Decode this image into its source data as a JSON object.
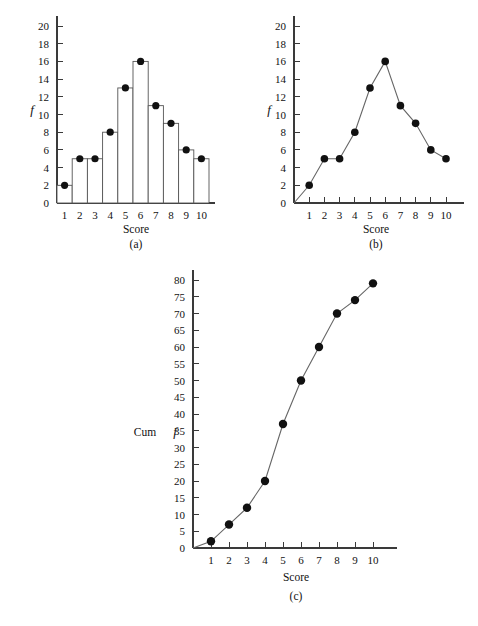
{
  "chart_data": [
    {
      "type": "bar",
      "panel": "(a)",
      "title": "",
      "xlabel": "Score",
      "ylabel": "f",
      "categories": [
        "1",
        "2",
        "3",
        "4",
        "5",
        "6",
        "7",
        "8",
        "9",
        "10"
      ],
      "values": [
        2,
        5,
        5,
        8,
        13,
        16,
        11,
        9,
        6,
        5
      ],
      "xlim": [
        0.5,
        10.5
      ],
      "ylim": [
        0,
        20
      ],
      "yticks": [
        0,
        2,
        4,
        6,
        8,
        10,
        12,
        14,
        16,
        18,
        20
      ],
      "ytick_labels": [
        "0",
        "2",
        "4",
        "6",
        "8",
        "10",
        "12",
        "14",
        "16",
        "18",
        "20"
      ],
      "xticks": [
        1,
        2,
        3,
        4,
        5,
        6,
        7,
        8,
        9,
        10
      ],
      "grid": false,
      "legend": "none",
      "markers": "filled-circle-at-bar-midpoint"
    },
    {
      "type": "line",
      "panel": "(b)",
      "title": "",
      "xlabel": "Score",
      "ylabel": "f",
      "categories": [
        "1",
        "2",
        "3",
        "4",
        "5",
        "6",
        "7",
        "8",
        "9",
        "10"
      ],
      "x": [
        0,
        1,
        2,
        3,
        4,
        5,
        6,
        7,
        8,
        9,
        10
      ],
      "values": [
        0,
        2,
        5,
        5,
        8,
        13,
        16,
        11,
        9,
        6,
        5
      ],
      "xlim": [
        0,
        11
      ],
      "ylim": [
        0,
        20
      ],
      "yticks": [
        0,
        2,
        4,
        6,
        8,
        10,
        12,
        14,
        16,
        18,
        20
      ],
      "ytick_labels": [
        "0",
        "2",
        "4",
        "6",
        "8",
        "10",
        "12",
        "14",
        "16",
        "18",
        "20"
      ],
      "xticks": [
        1,
        2,
        3,
        4,
        5,
        6,
        7,
        8,
        9,
        10
      ],
      "grid": false,
      "legend": "none",
      "markers": "filled-circle"
    },
    {
      "type": "line",
      "panel": "(c)",
      "title": "",
      "xlabel": "Score",
      "ylabel": "Cum f",
      "categories": [
        "1",
        "2",
        "3",
        "4",
        "5",
        "6",
        "7",
        "8",
        "9",
        "10"
      ],
      "x": [
        0,
        1,
        2,
        3,
        4,
        5,
        6,
        7,
        8,
        9,
        10
      ],
      "values": [
        0,
        2,
        7,
        12,
        20,
        37,
        50,
        60,
        70,
        74,
        79
      ],
      "xlim": [
        0,
        11
      ],
      "ylim": [
        0,
        80
      ],
      "yticks": [
        0,
        5,
        10,
        15,
        20,
        25,
        30,
        35,
        40,
        45,
        50,
        55,
        60,
        65,
        70,
        75,
        80
      ],
      "ytick_labels": [
        "0",
        "5",
        "10",
        "15",
        "20",
        "25",
        "30",
        "35",
        "40",
        "45",
        "50",
        "55",
        "60",
        "65",
        "70",
        "75",
        "80"
      ],
      "xticks": [
        1,
        2,
        3,
        4,
        5,
        6,
        7,
        8,
        9,
        10
      ],
      "grid": false,
      "legend": "none",
      "markers": "filled-circle"
    }
  ],
  "panel_a": {
    "caption": "(a)",
    "xlabel": "Score",
    "ylabel": "f",
    "ytick_labels": [
      "0",
      "2",
      "4",
      "6",
      "8",
      "10",
      "12",
      "14",
      "16",
      "18",
      "20"
    ],
    "xtick_labels": [
      "1",
      "2",
      "3",
      "4",
      "5",
      "6",
      "7",
      "8",
      "9",
      "10"
    ]
  },
  "panel_b": {
    "caption": "(b)",
    "xlabel": "Score",
    "ylabel": "f",
    "ytick_labels": [
      "0",
      "2",
      "4",
      "6",
      "8",
      "10",
      "12",
      "14",
      "16",
      "18",
      "20"
    ],
    "xtick_labels": [
      "1",
      "2",
      "3",
      "4",
      "5",
      "6",
      "7",
      "8",
      "9",
      "10"
    ]
  },
  "panel_c": {
    "caption": "(c)",
    "xlabel": "Score",
    "ylabel_prefix": "Cum ",
    "ylabel_symbol": "f",
    "ytick_labels": [
      "0",
      "5",
      "10",
      "15",
      "20",
      "25",
      "30",
      "35",
      "40",
      "45",
      "50",
      "55",
      "60",
      "65",
      "70",
      "75",
      "80"
    ],
    "xtick_labels": [
      "1",
      "2",
      "3",
      "4",
      "5",
      "6",
      "7",
      "8",
      "9",
      "10"
    ]
  },
  "colors": {
    "axis": "#3a3a3a",
    "bar_stroke": "#555555",
    "line": "#666666",
    "marker": "#111111",
    "text": "#111111",
    "background": "#ffffff"
  }
}
